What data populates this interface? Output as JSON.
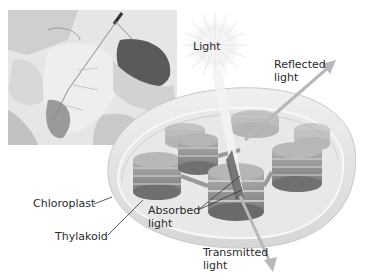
{
  "diagram": {
    "labels": {
      "light": "Light",
      "reflected_line1": "Reflected",
      "reflected_line2": "light",
      "chloroplast": "Chloroplast",
      "thylakoid": "Thylakoid",
      "absorbed_line1": "Absorbed",
      "absorbed_line2": "light",
      "transmitted_line1": "Transmitted",
      "transmitted_line2": "light"
    },
    "colors": {
      "label_text": "#2a2a2a",
      "leader_line": "#333333",
      "arrow": "#b8b8b8",
      "chloroplast_fill": "#e4e4e4",
      "thylakoid_fill": "#8e8e8e",
      "background": "#ffffff"
    }
  }
}
